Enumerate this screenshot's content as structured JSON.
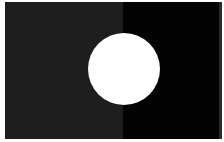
{
  "image": {
    "description": "White circle centered over a field split vertically into dark gray (left) and black (right)",
    "colors": {
      "left_field": "#1e1e1e",
      "right_field": "#030303",
      "circle": "#ffffff",
      "border": "#ffffff"
    },
    "circle": {
      "cx": 124,
      "cy": 69,
      "r": 36
    }
  }
}
